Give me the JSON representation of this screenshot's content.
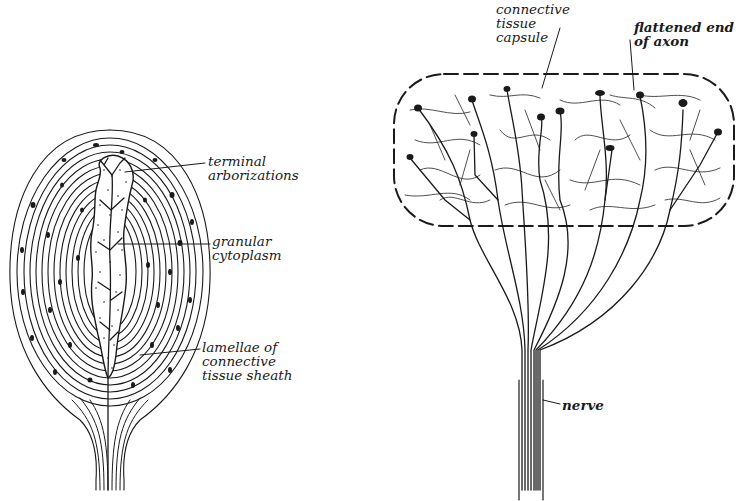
{
  "figures": {
    "left": {
      "name": "lamellated-corpuscle",
      "labels": [
        {
          "id": "terminal-arborizations",
          "text": "terminal\narborizations"
        },
        {
          "id": "granular-cytoplasm",
          "text": "granular\ncytoplasm"
        },
        {
          "id": "lamellae-sheath",
          "text": "lamellae of\nconnective\ntissue sheath"
        }
      ]
    },
    "right": {
      "name": "encapsulated-ending",
      "labels": [
        {
          "id": "connective-tissue-capsule",
          "text": "connective\ntissue\ncapsule"
        },
        {
          "id": "flattened-end-of-axon",
          "text": "flattened end\nof axon"
        },
        {
          "id": "nerve",
          "text": "nerve"
        }
      ]
    }
  },
  "colors": {
    "ink": "#1a1a1a",
    "paper": "#ffffff"
  }
}
